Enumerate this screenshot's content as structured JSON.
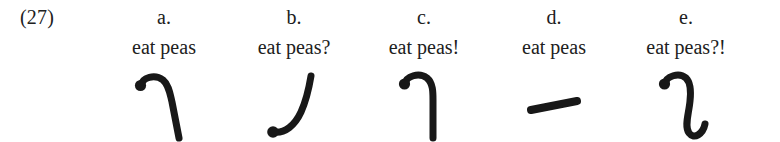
{
  "figure": {
    "example_number": "(27)",
    "background_color": "#ffffff",
    "ink_color": "#181818"
  },
  "items": [
    {
      "letter": "a.",
      "utterance": "eat peas",
      "gesture_name": "hook-stroke-down-right",
      "gesture_description": "rounded onset dot at upper left, arc rightward over the top, then a long straight descent to lower right"
    },
    {
      "letter": "b.",
      "utterance": "eat peas?",
      "gesture_name": "rising-j-stroke",
      "gesture_description": "rounded onset dot at lower left, sweeping upward curve to the right ending high"
    },
    {
      "letter": "c.",
      "utterance": "eat peas!",
      "gesture_name": "hook-stroke-steep-down",
      "gesture_description": "rounded onset dot at upper left, short arc over the top, then a steep nearly vertical descent"
    },
    {
      "letter": "d.",
      "utterance": "eat peas",
      "gesture_name": "flat-dash-stroke",
      "gesture_description": "short straight level stroke slanting slightly upward from left to right"
    },
    {
      "letter": "e.",
      "utterance": "eat peas?!",
      "gesture_name": "s-curve-stroke",
      "gesture_description": "rounded onset dot at upper left, arc over the top, long descent, then a hook curving back up to the right"
    }
  ]
}
